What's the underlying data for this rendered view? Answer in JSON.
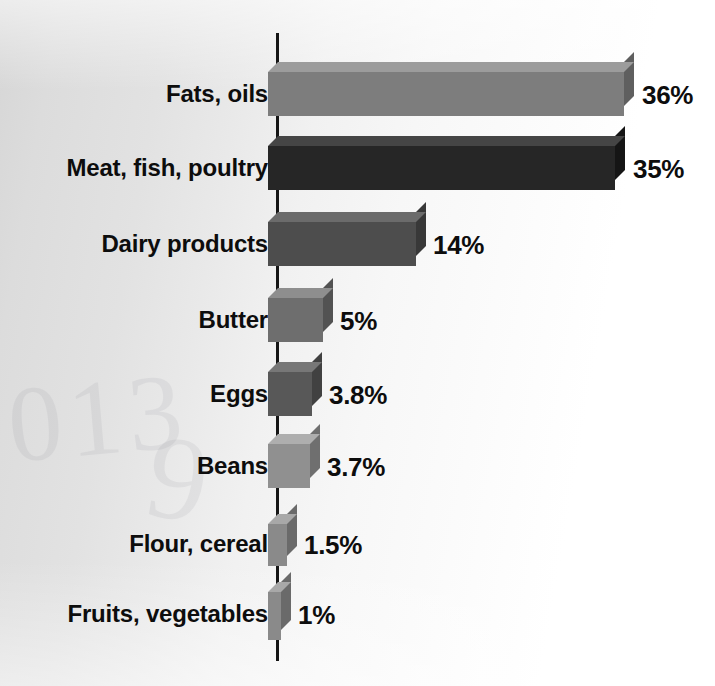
{
  "chart_data": {
    "type": "bar",
    "orientation": "horizontal",
    "title": "",
    "subtitle": "",
    "xlabel": "",
    "ylabel": "",
    "xlim": [
      0,
      36
    ],
    "grid": false,
    "legend": null,
    "axis_line": "vertical category axis at left of bars",
    "value_suffix": "%",
    "categories": [
      "Fats, oils",
      "Meat, fish, poultry",
      "Dairy products",
      "Butter",
      "Eggs",
      "Beans",
      "Flour, cereal",
      "Fruits, vegetables"
    ],
    "values": [
      36,
      35,
      14,
      5,
      3.8,
      3.7,
      1.5,
      1
    ],
    "value_labels": [
      "36%",
      "35%",
      "14%",
      "5%",
      "3.8%",
      "3.7%",
      "1.5%",
      "1%"
    ],
    "bar_colors": [
      "#7d7d7d",
      "#262626",
      "#4d4d4d",
      "#6e6e6e",
      "#585858",
      "#909090",
      "#8a8a8a",
      "#8a8a8a"
    ],
    "bars": [
      {
        "category": "Fats, oils",
        "value": 36,
        "value_label": "36%",
        "color": "#7d7d7d",
        "top_color": "#9c9c9c",
        "side_color": "#5f5f5f",
        "top": 72,
        "height": 44,
        "width": 356,
        "label_top": 82,
        "value_left": 642
      },
      {
        "category": "Meat, fish, poultry",
        "value": 35,
        "value_label": "35%",
        "color": "#262626",
        "top_color": "#454545",
        "side_color": "#151515",
        "top": 146,
        "height": 44,
        "width": 347,
        "label_top": 156,
        "value_left": 633
      },
      {
        "category": "Dairy products",
        "value": 14,
        "value_label": "14%",
        "color": "#4d4d4d",
        "top_color": "#6b6b6b",
        "side_color": "#383838",
        "top": 222,
        "height": 44,
        "width": 148,
        "label_top": 232,
        "value_left": 433
      },
      {
        "category": "Butter",
        "value": 5,
        "value_label": "5%",
        "color": "#6e6e6e",
        "top_color": "#8e8e8e",
        "side_color": "#525252",
        "top": 298,
        "height": 44,
        "width": 55,
        "label_top": 308,
        "value_left": 340
      },
      {
        "category": "Eggs",
        "value": 3.8,
        "value_label": "3.8%",
        "color": "#585858",
        "top_color": "#777777",
        "side_color": "#414141",
        "top": 372,
        "height": 44,
        "width": 44,
        "label_top": 382,
        "value_left": 329
      },
      {
        "category": "Beans",
        "value": 3.7,
        "value_label": "3.7%",
        "color": "#909090",
        "top_color": "#aeaeae",
        "side_color": "#6f6f6f",
        "top": 444,
        "height": 44,
        "width": 42,
        "label_top": 454,
        "value_left": 327
      },
      {
        "category": "Flour, cereal",
        "value": 1.5,
        "value_label": "1.5%",
        "color": "#8a8a8a",
        "top_color": "#a8a8a8",
        "side_color": "#6a6a6a",
        "top": 524,
        "height": 42,
        "width": 19,
        "label_top": 532,
        "value_left": 304
      },
      {
        "category": "Fruits, vegetables",
        "value": 1,
        "value_label": "1%",
        "color": "#8a8a8a",
        "top_color": "#a8a8a8",
        "side_color": "#6a6a6a",
        "top": 592,
        "height": 48,
        "width": 13,
        "label_top": 602,
        "value_left": 298
      }
    ]
  },
  "background": {
    "ghost_ink_a": "013",
    "ghost_ink_b": "9"
  }
}
